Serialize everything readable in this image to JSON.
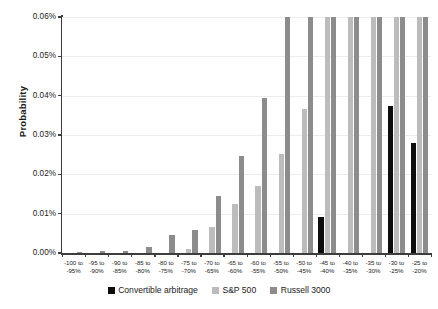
{
  "chart_data": {
    "type": "bar",
    "title": "",
    "subtitle": "",
    "xlabel": "",
    "ylabel": "Probability",
    "ylim": [
      0,
      0.06
    ],
    "ytick_labels": [
      "0.00%",
      "0.01%",
      "0.02%",
      "0.03%",
      "0.04%",
      "0.05%",
      "0.06%"
    ],
    "ytick_values": [
      0,
      0.01,
      0.02,
      0.03,
      0.04,
      0.05,
      0.06
    ],
    "grid": true,
    "legend_position": "bottom",
    "value_unit": "%",
    "note": "Bars for the rightmost categories are clipped at the 0.06% axis maximum.",
    "categories": [
      "-100 to -95%",
      "-95 to -90%",
      "-90 to -85%",
      "-85 to -80%",
      "-80 to -75%",
      "-75 to -70%",
      "-70 to -65%",
      "-65 to -60%",
      "-60 to -55%",
      "-55 to -50%",
      "-50 to -45%",
      "-45 to -40%",
      "-40 to -35%",
      "-35 to -30%",
      "-30 to -25%",
      "-25 to -20%"
    ],
    "category_lines": [
      [
        "-100 to",
        "-95%"
      ],
      [
        "-95 to",
        "-90%"
      ],
      [
        "-90 to",
        "-85%"
      ],
      [
        "-85 to",
        "-80%"
      ],
      [
        "-80 to",
        "-75%"
      ],
      [
        "-75 to",
        "-70%"
      ],
      [
        "-70 to",
        "-65%"
      ],
      [
        "-65 to",
        "-60%"
      ],
      [
        "-60 to",
        "-55%"
      ],
      [
        "-55 to",
        "-50%"
      ],
      [
        "-50 to",
        "-45%"
      ],
      [
        "-45 to",
        "-40%"
      ],
      [
        "-40 to",
        "-35%"
      ],
      [
        "-35 to",
        "-30%"
      ],
      [
        "-30 to",
        "-25%"
      ],
      [
        "-25 to",
        "-20%"
      ]
    ],
    "series": [
      {
        "name": "Convertible arbitrage",
        "color": "#0d0d0d",
        "key": "s-conv",
        "values": [
          0,
          0,
          0,
          0,
          0,
          0,
          0,
          0,
          0,
          0,
          0,
          0.0091,
          0,
          0,
          0.0375,
          0.028
        ]
      },
      {
        "name": "S&P 500",
        "color": "#bcbcbc",
        "key": "s-sp",
        "values": [
          0,
          0,
          0,
          0,
          0,
          0.0009,
          0.0067,
          0.0125,
          0.017,
          0.0252,
          0.0366,
          0.06,
          0.06,
          0.06,
          0.06,
          0.06
        ]
      },
      {
        "name": "Russell 3000",
        "color": "#8c8c8c",
        "key": "s-rus",
        "values": [
          0.0002,
          0.0004,
          0.0006,
          0.0015,
          0.0045,
          0.0058,
          0.0146,
          0.0247,
          0.0393,
          0.06,
          0.06,
          0.06,
          0.06,
          0.06,
          0.06,
          0.06
        ]
      }
    ]
  },
  "legend": {
    "items": [
      {
        "label": "Convertible arbitrage",
        "key": "s-conv"
      },
      {
        "label": "S&P 500",
        "key": "s-sp"
      },
      {
        "label": "Russell 3000",
        "key": "s-rus"
      }
    ]
  }
}
